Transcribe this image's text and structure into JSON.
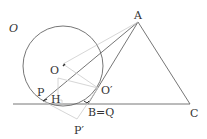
{
  "diagram": {
    "labels": {
      "circle": "O",
      "center": "O",
      "A": "A",
      "C": "C",
      "P": "P",
      "H": "H",
      "O_prime": "O′",
      "B_Q": "B=Q",
      "P_prime": "P′"
    },
    "colors": {
      "main_line": "#666666",
      "construction_line": "#cccccc",
      "label": "#333333"
    }
  }
}
